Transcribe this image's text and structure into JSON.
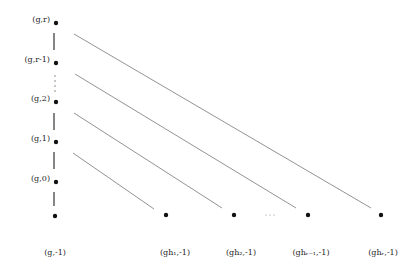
{
  "diagram": {
    "vertical_nodes": [
      {
        "label": "(g,r)",
        "x": 56,
        "y": 23
      },
      {
        "label": "(g,r-1)",
        "x": 56,
        "y": 63
      },
      {
        "label": "(g,2)",
        "x": 56,
        "y": 102
      },
      {
        "label": "(g,1)",
        "x": 56,
        "y": 142
      },
      {
        "label": "(g,0)",
        "x": 56,
        "y": 182
      },
      {
        "label": "",
        "x": 55,
        "y": 216
      }
    ],
    "vertical_ellipsis": "⋮",
    "bottom_nodes": [
      {
        "label": "(g,-1)",
        "x": 55,
        "y": 216
      },
      {
        "label": "(gh1,-1)",
        "x": 166,
        "y": 215
      },
      {
        "label": "(gh2,-1)",
        "x": 234,
        "y": 215
      },
      {
        "label": "(ghr-1,-1)",
        "x": 308,
        "y": 215
      },
      {
        "label": "(ghr,-1)",
        "x": 381,
        "y": 215
      }
    ],
    "bottom_ellipsis": "···",
    "labels": {
      "g_r": "(g,r)",
      "g_r_minus_1": "(g,r-1)",
      "g_2": "(g,2)",
      "g_1": "(g,1)",
      "g_0": "(g,0)",
      "g_minus_1": "(g,-1)",
      "gh1": "(gh₁,-1)",
      "gh2": "(gh₂,-1)",
      "ghr_minus_1": "(ghᵣ₋₁,-1)",
      "ghr": "(ghᵣ,-1)"
    },
    "colors": {
      "node": "#111111",
      "edge_vertical": "#333333",
      "edge_diagonal": "#777777",
      "text": "#222222"
    }
  }
}
